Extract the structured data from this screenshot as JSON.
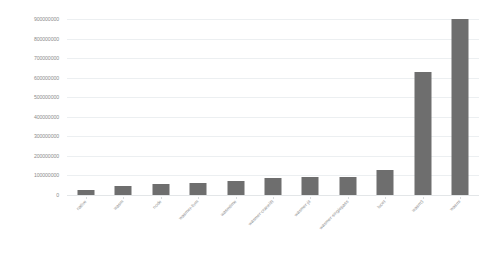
{
  "chart_data": {
    "type": "bar",
    "title": "",
    "subtitle": "",
    "xlabel": "",
    "ylabel": "",
    "ylim": [
      0,
      900000000
    ],
    "grid": true,
    "legend": false,
    "legend_position": "none",
    "bar_color": "#6e6e6e",
    "background_color": "#ffffff",
    "gridline_color": "#eceff1",
    "axis_text_color": "#8c8c8c",
    "categories": [
      "native",
      "wasm",
      "node",
      "wasmer-llvm",
      "wasmtime",
      "wasmer-cranelift",
      "wasmer-jit",
      "wasmer-singlepass",
      "lucet",
      "wasm3",
      "wasmi"
    ],
    "values": [
      25000000,
      45000000,
      55000000,
      62000000,
      70000000,
      88000000,
      90000000,
      90000000,
      130000000,
      630000000,
      900000000
    ],
    "ytick_values": [
      0,
      100000000,
      200000000,
      300000000,
      400000000,
      500000000,
      600000000,
      700000000,
      800000000,
      900000000
    ],
    "ytick_labels": [
      "0",
      "100000000",
      "200000000",
      "300000000",
      "400000000",
      "500000000",
      "600000000",
      "700000000",
      "800000000",
      "900000000"
    ]
  }
}
